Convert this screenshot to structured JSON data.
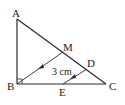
{
  "diagram": {
    "type": "geometry-triangle",
    "points": {
      "A": {
        "label": "A",
        "x": 17,
        "y": 19
      },
      "B": {
        "label": "B",
        "x": 17,
        "y": 84
      },
      "C": {
        "label": "C",
        "x": 106,
        "y": 84
      },
      "M": {
        "label": "M",
        "x": 63,
        "y": 52
      },
      "D": {
        "label": "D",
        "x": 87,
        "y": 69
      },
      "E": {
        "label": "E",
        "x": 63,
        "y": 84
      }
    },
    "segments": [
      "AB",
      "BC",
      "AC",
      "MB",
      "DE"
    ],
    "parallel_marks": [
      "MB",
      "DE"
    ],
    "right_angle_at": "B",
    "measurement_label": "3 cm",
    "colors": {
      "stroke": "#2a2a2a",
      "text": "#222222"
    }
  }
}
